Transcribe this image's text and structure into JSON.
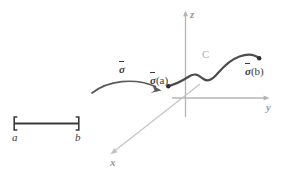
{
  "figure": {
    "colors": {
      "axis": "#b4b4b4",
      "curve": "#4d4d4d",
      "interval": "#3b3b3b",
      "map_arrow": "#5a5a5a",
      "curve_label": "#b0b0b0",
      "background": "#ffffff"
    }
  },
  "axes": {
    "z_label": "z",
    "y_label": "y",
    "x_label": "x"
  },
  "interval": {
    "left_bracket": "[",
    "right_bracket": "]",
    "left_label": "a",
    "right_label": "b"
  },
  "map": {
    "sigma": "σ"
  },
  "curve": {
    "label": "C",
    "start_sigma": "σ",
    "start_arg": "(a)",
    "end_sigma": "σ",
    "end_arg": "(b)"
  }
}
